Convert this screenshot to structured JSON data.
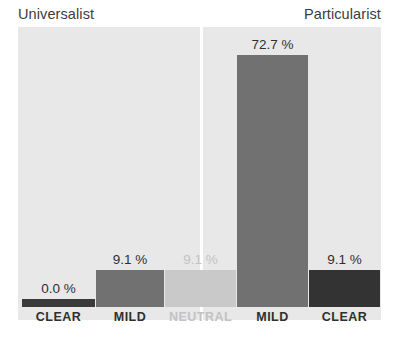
{
  "chart_data": {
    "type": "bar",
    "title": "",
    "subtitle": "",
    "xlabel": "",
    "ylabel": "",
    "ylim": [
      0,
      100
    ],
    "grid": false,
    "legend": "none",
    "value_suffix": "%",
    "groups": [
      {
        "name": "Universalist",
        "align": "left"
      },
      {
        "name": "Particularist",
        "align": "right"
      }
    ],
    "categories": [
      "CLEAR",
      "MILD",
      "NEUTRAL",
      "MILD",
      "CLEAR"
    ],
    "values": [
      0.0,
      9.1,
      9.1,
      72.7,
      9.1
    ],
    "value_labels": [
      "0.0 %",
      "9.1 %",
      "9.1 %",
      "72.7 %",
      "9.1 %"
    ],
    "bars": [
      {
        "category": "CLEAR",
        "group": "Universalist",
        "value": 0.0,
        "value_label": "0.0 %",
        "color": "#3a3a3a",
        "label_color": "#2f2f2f",
        "x": 22,
        "width": 73,
        "height": 8
      },
      {
        "category": "MILD",
        "group": "Universalist",
        "value": 9.1,
        "value_label": "9.1 %",
        "color": "#717171",
        "label_color": "#2f2f2f",
        "x": 96,
        "width": 68,
        "height": 37
      },
      {
        "category": "NEUTRAL",
        "group": "Universalist",
        "value": 9.1,
        "value_label": "9.1 %",
        "color": "#c9c9c9",
        "label_color": "#c2c2c2",
        "x": 165,
        "width": 71,
        "height": 37
      },
      {
        "category": "MILD",
        "group": "Particularist",
        "value": 72.7,
        "value_label": "72.7 %",
        "color": "#717171",
        "label_color": "#2f2f2f",
        "x": 237,
        "width": 71,
        "height": 252
      },
      {
        "category": "CLEAR",
        "group": "Particularist",
        "value": 9.1,
        "value_label": "9.1 %",
        "color": "#333333",
        "label_color": "#2f2f2f",
        "x": 309,
        "width": 71,
        "height": 37
      }
    ]
  },
  "colors": {
    "panel_background": "#e8e8e8",
    "page_background": "#ffffff",
    "divider": "#ffffff",
    "title_text": "#3c3c3c",
    "axis_text": "#2f2f2f",
    "axis_text_muted": "#c2c2c2"
  },
  "caption": {
    "text": ""
  }
}
